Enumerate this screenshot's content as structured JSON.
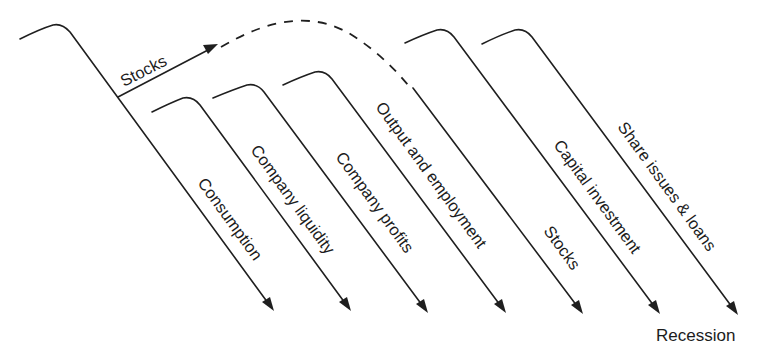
{
  "diagram": {
    "type": "causal-sequence",
    "branch": {
      "label": "Stocks",
      "style_to_next": "dashed-arc"
    },
    "channels": [
      {
        "id": "consumption",
        "label": "Consumption"
      },
      {
        "id": "company-liquidity",
        "label": "Company liquidity"
      },
      {
        "id": "company-profits",
        "label": "Company profits"
      },
      {
        "id": "output-employment",
        "label": "Output and employment"
      },
      {
        "id": "stocks",
        "label": "Stocks"
      },
      {
        "id": "capital-investment",
        "label": "Capital investment"
      },
      {
        "id": "share-issues-loans",
        "label": "Share issues & loans"
      }
    ],
    "outcome": "Recession",
    "colors": {
      "ink": "#1f1f1f",
      "background": "#ffffff"
    }
  }
}
